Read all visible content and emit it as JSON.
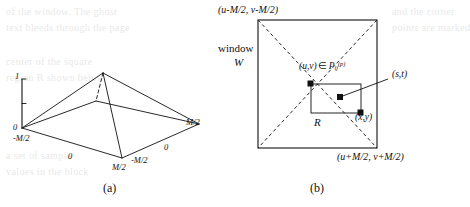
{
  "figure": {
    "caption_a": "(a)",
    "caption_b": "(b)"
  },
  "panel_a": {
    "name": "pyramid-3d-plot",
    "axis_value_top": "1",
    "axis_value_origin": "0",
    "tick_left_front": "-M/2",
    "tick_front_mid": "0",
    "tick_front_right": "M/2",
    "tick_right_near": "-M/2",
    "tick_right_mid": "0",
    "tick_right_far": "M/2"
  },
  "panel_b": {
    "name": "window-square-diagram",
    "top_left_corner_label": "(u-M/2, v-M/2)",
    "bottom_right_corner_label": "(u+M/2, v+M/2)",
    "window_label_line1": "window",
    "window_label_line2": "W",
    "center_point_label_prefix": "(u,v)",
    "center_point_membership": "∈",
    "center_point_set_base": "P",
    "center_point_set_sub": "ij",
    "center_point_set_sup": "(p)",
    "point_st_label": "(s,t)",
    "point_xy_label": "(x,y)",
    "rect_label": "R"
  },
  "ghost_text": [
    "of the window. The ghost",
    "text bleeds through the page",
    "center of the square",
    "region R shown below",
    "and the corner",
    "points are marked",
    "a set of sample",
    "values in the block"
  ],
  "colors": {
    "ink": "#111111",
    "ghost": "#b9b9b9",
    "paper": "#ffffff"
  }
}
